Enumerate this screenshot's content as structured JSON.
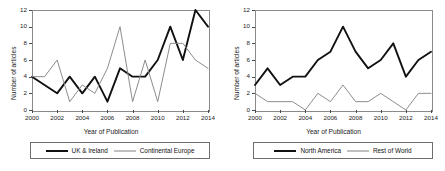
{
  "figure": {
    "panels": [
      {
        "id": "left",
        "chart_data": {
          "type": "line",
          "title": "",
          "xlabel": "Year of Publication",
          "ylabel": "Number of articles",
          "x": [
            2000,
            2001,
            2002,
            2003,
            2004,
            2005,
            2006,
            2007,
            2008,
            2009,
            2010,
            2011,
            2012,
            2013,
            2014
          ],
          "xlim": [
            2000,
            2014
          ],
          "ylim": [
            0,
            12
          ],
          "xticks": [
            2000,
            2002,
            2004,
            2006,
            2008,
            2010,
            2012,
            2014
          ],
          "yticks": [
            0,
            2,
            4,
            6,
            8,
            10,
            12
          ],
          "grid": false,
          "legend_position": "below",
          "series": [
            {
              "name": "UK & Ireland",
              "color": "#111111",
              "width": 1.9,
              "values": [
                4,
                3,
                2,
                4,
                2,
                4,
                1,
                5,
                4,
                4,
                6,
                10,
                6,
                12,
                10
              ]
            },
            {
              "name": "Continental Europe",
              "color": "#8c8c8c",
              "width": 1.0,
              "values": [
                4,
                4,
                6,
                1,
                3,
                2,
                5,
                10,
                1,
                6,
                1,
                8,
                8,
                6,
                5
              ]
            }
          ]
        }
      },
      {
        "id": "right",
        "chart_data": {
          "type": "line",
          "title": "",
          "xlabel": "Year of Publication",
          "ylabel": "Number of articles",
          "x": [
            2000,
            2001,
            2002,
            2003,
            2004,
            2005,
            2006,
            2007,
            2008,
            2009,
            2010,
            2011,
            2012,
            2013,
            2014
          ],
          "xlim": [
            2000,
            2014
          ],
          "ylim": [
            0,
            12
          ],
          "xticks": [
            2000,
            2002,
            2004,
            2006,
            2008,
            2010,
            2012,
            2014
          ],
          "yticks": [
            0,
            2,
            4,
            6,
            8,
            10,
            12
          ],
          "grid": false,
          "legend_position": "below",
          "series": [
            {
              "name": "North America",
              "color": "#111111",
              "width": 1.9,
              "values": [
                3,
                5,
                3,
                4,
                4,
                6,
                7,
                10,
                7,
                5,
                6,
                8,
                4,
                6,
                7
              ]
            },
            {
              "name": "Rest of World",
              "color": "#8c8c8c",
              "width": 1.0,
              "values": [
                2,
                1,
                1,
                1,
                0,
                2,
                1,
                3,
                1,
                1,
                2,
                1,
                0,
                2,
                2
              ]
            }
          ]
        }
      }
    ]
  }
}
